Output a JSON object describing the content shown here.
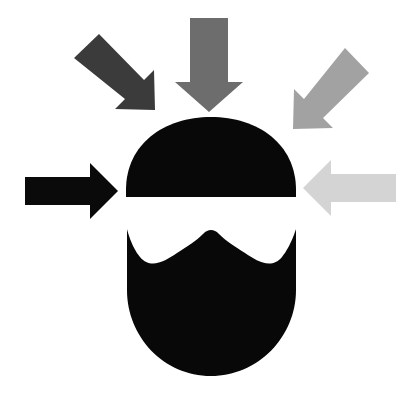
{
  "figure": {
    "title": "Pressure converging on a head",
    "background_color": "#ffffff",
    "width": 412,
    "height": 399,
    "description": "Black silhouette of a stylized head split by a white horizontal band, surrounded by five arrows of decreasing darkness pointing inward"
  },
  "head": {
    "label": "head-silhouette",
    "color": "#080808",
    "upper": {
      "label": "cranium-dome",
      "cx": 211,
      "top_y": 117,
      "bottom_y": 197,
      "left_x": 126,
      "right_x": 296
    },
    "gap": {
      "label": "eye-band-gap",
      "color": "#ffffff",
      "top_y": 197,
      "bottom_y": 228
    },
    "lower": {
      "label": "jaw-and-nose",
      "top_y": 228,
      "bottom_y": 376,
      "left_x": 127,
      "right_x": 296,
      "nose_peak_y": 232,
      "cheek_dip_y": 256
    }
  },
  "arrows": [
    {
      "id": "arrow-left",
      "name": "arrow-from-left",
      "direction": "right",
      "color": "#0a0a0a",
      "shade_label": "black",
      "order": 1
    },
    {
      "id": "arrow-top-left",
      "name": "arrow-from-top-left",
      "direction": "down-right",
      "color": "#3b3b3b",
      "shade_label": "dark gray",
      "order": 2
    },
    {
      "id": "arrow-top",
      "name": "arrow-from-top",
      "direction": "down",
      "color": "#6d6d6d",
      "shade_label": "medium gray",
      "order": 3
    },
    {
      "id": "arrow-top-right",
      "name": "arrow-from-top-right",
      "direction": "down-left",
      "color": "#a2a2a2",
      "shade_label": "light gray",
      "order": 4
    },
    {
      "id": "arrow-right",
      "name": "arrow-from-right",
      "direction": "left",
      "color": "#d4d4d4",
      "shade_label": "pale gray",
      "order": 5
    }
  ],
  "paths": {
    "dome": "M 126 197 L 296 197 L 296 190 C 296 144 258 117 211 117 C 164 117 126 144 126 190 Z",
    "jaw": "M 127 229 C 127 229 131 246 140 257 C 151 270 165 261 177 253 C 188 246 196 241 203 234 C 206 231 208 230 211 230 C 214 230 216 231 219 234 C 226 241 234 246 245 253 C 257 261 271 270 282 257 C 291 246 296 229 296 229 L 296 290 C 296 337 258 376 211 376 C 164 376 127 337 127 290 Z",
    "arrow_left": "M 25 177 L 90 177 L 90 163 L 118 191 L 90 219 L 90 205 L 25 205 Z",
    "arrow_top": "M 190 18 L 228 18 L 228 82 L 243 82 L 209 112 L 175 82 L 190 82 Z",
    "arrow_right": "M 396 174 L 331 174 L 331 160 L 303 188 L 331 216 L 331 202 L 396 202 Z",
    "arrow_top_left": "M 74 58 L 99 34 L 144 80 L 154 70 L 155 110 L 115 109 L 125 99 Z",
    "arrow_top_right": "M 345 48 L 369 73 L 323 118 L 333 128 L 293 129 L 294 89 L 304 99 Z"
  }
}
